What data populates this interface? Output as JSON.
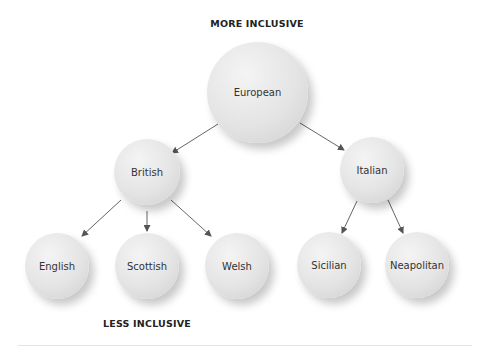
{
  "labels": {
    "top": "MORE INCLUSIVE",
    "bottom": "LESS INCLUSIVE"
  },
  "nodes": {
    "european": "European",
    "british": "British",
    "italian": "Italian",
    "english": "English",
    "scottish": "Scottish",
    "welsh": "Welsh",
    "sicilian": "Sicilian",
    "neapolitan": "Neapolitan"
  },
  "edges": [
    [
      "European",
      "British"
    ],
    [
      "European",
      "Italian"
    ],
    [
      "British",
      "English"
    ],
    [
      "British",
      "Scottish"
    ],
    [
      "British",
      "Welsh"
    ],
    [
      "Italian",
      "Sicilian"
    ],
    [
      "Italian",
      "Neapolitan"
    ]
  ],
  "colors": {
    "node_fill": "#e4e4e4",
    "edge": "#555555",
    "text": "#333333"
  }
}
